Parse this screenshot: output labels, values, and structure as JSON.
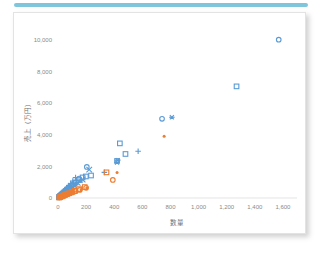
{
  "accent": {
    "color": "#7fc6dd"
  },
  "card": {
    "background": "#ffffff",
    "border_color": "#e3e3e3"
  },
  "chart_data": {
    "type": "scatter",
    "title": "",
    "xlabel": "数量",
    "ylabel": "売上（万円）",
    "xlim": [
      0,
      1700
    ],
    "ylim": [
      0,
      10800
    ],
    "xticks": [
      0,
      200,
      400,
      600,
      800,
      1000,
      1200,
      1400,
      1600
    ],
    "xtick_labels": [
      "0",
      "200",
      "400",
      "600",
      "800",
      "1,000",
      "1,200",
      "1,400",
      "1,600"
    ],
    "yticks": [
      0,
      2000,
      4000,
      6000,
      8000,
      10000
    ],
    "ytick_labels": [
      "0",
      "2,000",
      "4,000",
      "6,000",
      "8,000",
      "10,000"
    ],
    "grid": false,
    "legend": "none",
    "colors": {
      "blue": "#5b9bd5",
      "orange": "#ed7d31"
    },
    "series": [
      {
        "name": "series-circle-blue",
        "marker": "circle",
        "color": "#5b9bd5",
        "points": [
          [
            1570,
            10000
          ],
          [
            740,
            5000
          ],
          [
            205,
            1960
          ],
          [
            150,
            1230
          ],
          [
            118,
            980
          ],
          [
            96,
            760
          ],
          [
            80,
            660
          ],
          [
            70,
            560
          ],
          [
            58,
            470
          ],
          [
            48,
            395
          ],
          [
            40,
            330
          ],
          [
            33,
            270
          ],
          [
            27,
            215
          ],
          [
            22,
            170
          ],
          [
            17,
            130
          ],
          [
            13,
            95
          ],
          [
            9,
            62
          ],
          [
            6,
            35
          ]
        ]
      },
      {
        "name": "series-square-blue",
        "marker": "square",
        "color": "#5b9bd5",
        "points": [
          [
            1270,
            7050
          ],
          [
            440,
            3450
          ],
          [
            480,
            2780
          ],
          [
            420,
            2340
          ],
          [
            235,
            1420
          ],
          [
            198,
            1360
          ],
          [
            175,
            1300
          ],
          [
            148,
            1130
          ],
          [
            126,
            980
          ],
          [
            108,
            850
          ],
          [
            92,
            730
          ],
          [
            78,
            620
          ],
          [
            65,
            520
          ],
          [
            54,
            430
          ],
          [
            44,
            350
          ],
          [
            35,
            278
          ],
          [
            27,
            212
          ],
          [
            20,
            152
          ],
          [
            14,
            100
          ],
          [
            8,
            52
          ]
        ]
      },
      {
        "name": "series-plus-blue",
        "marker": "plus",
        "color": "#5b9bd5",
        "points": [
          [
            570,
            2950
          ],
          [
            330,
            1620
          ],
          [
            125,
            1290
          ],
          [
            105,
            1075
          ],
          [
            90,
            905
          ],
          [
            77,
            780
          ],
          [
            66,
            670
          ],
          [
            56,
            570
          ],
          [
            47,
            480
          ],
          [
            39,
            400
          ],
          [
            32,
            325
          ],
          [
            25,
            255
          ],
          [
            19,
            190
          ],
          [
            13,
            128
          ],
          [
            7,
            68
          ]
        ]
      },
      {
        "name": "series-asterisk-blue",
        "marker": "asterisk",
        "color": "#5b9bd5",
        "points": [
          [
            810,
            5100
          ],
          [
            425,
            2395
          ],
          [
            420,
            2240
          ],
          [
            160,
            1075
          ],
          [
            122,
            870
          ],
          [
            101,
            735
          ],
          [
            86,
            630
          ],
          [
            72,
            540
          ],
          [
            60,
            455
          ],
          [
            50,
            378
          ],
          [
            41,
            308
          ],
          [
            33,
            244
          ],
          [
            25,
            184
          ],
          [
            18,
            128
          ],
          [
            11,
            72
          ]
        ]
      },
      {
        "name": "series-x-blue",
        "marker": "x",
        "color": "#5b9bd5",
        "points": [
          [
            222,
            1790
          ],
          [
            175,
            1165
          ],
          [
            140,
            955
          ],
          [
            115,
            800
          ],
          [
            97,
            690
          ],
          [
            83,
            595
          ],
          [
            70,
            508
          ],
          [
            59,
            428
          ],
          [
            49,
            355
          ],
          [
            40,
            288
          ],
          [
            31,
            225
          ],
          [
            23,
            166
          ],
          [
            15,
            108
          ],
          [
            8,
            55
          ]
        ]
      },
      {
        "name": "series-circle-orange",
        "marker": "circle",
        "color": "#ed7d31",
        "points": [
          [
            390,
            1140
          ],
          [
            200,
            640
          ],
          [
            155,
            510
          ],
          [
            125,
            420
          ],
          [
            102,
            350
          ],
          [
            84,
            290
          ],
          [
            68,
            238
          ],
          [
            54,
            190
          ],
          [
            42,
            148
          ],
          [
            31,
            108
          ],
          [
            21,
            72
          ],
          [
            12,
            40
          ]
        ]
      },
      {
        "name": "series-square-orange",
        "marker": "square",
        "color": "#ed7d31",
        "points": [
          [
            345,
            1620
          ],
          [
            190,
            690
          ],
          [
            150,
            560
          ],
          [
            120,
            455
          ],
          [
            98,
            375
          ],
          [
            80,
            308
          ],
          [
            64,
            250
          ],
          [
            50,
            196
          ],
          [
            38,
            148
          ],
          [
            27,
            104
          ],
          [
            17,
            64
          ],
          [
            9,
            30
          ]
        ]
      },
      {
        "name": "series-dot-orange",
        "marker": "dot",
        "color": "#ed7d31",
        "points": [
          [
            755,
            3900
          ],
          [
            420,
            1610
          ],
          [
            205,
            625
          ],
          [
            165,
            520
          ],
          [
            133,
            430
          ],
          [
            108,
            355
          ],
          [
            88,
            292
          ],
          [
            71,
            236
          ],
          [
            56,
            186
          ],
          [
            43,
            140
          ],
          [
            31,
            100
          ],
          [
            20,
            62
          ],
          [
            10,
            30
          ]
        ]
      }
    ]
  }
}
